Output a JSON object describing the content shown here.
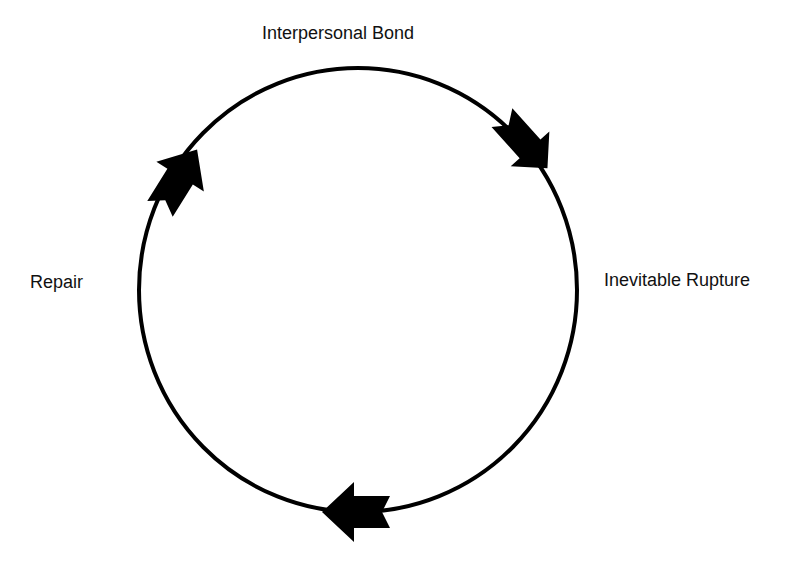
{
  "diagram": {
    "nodes": [
      {
        "id": "bond",
        "label": "Interpersonal Bond",
        "position": "top"
      },
      {
        "id": "rupture",
        "label": "Inevitable Rupture",
        "position": "right"
      },
      {
        "id": "repair",
        "label": "Repair",
        "position": "left"
      }
    ],
    "edges": [
      {
        "from": "bond",
        "to": "rupture",
        "direction": "clockwise"
      },
      {
        "from": "rupture",
        "to": "repair",
        "direction": "clockwise"
      },
      {
        "from": "repair",
        "to": "bond",
        "direction": "clockwise"
      }
    ],
    "colors": {
      "stroke": "#000000",
      "text": "#111111",
      "background": "#ffffff"
    }
  }
}
